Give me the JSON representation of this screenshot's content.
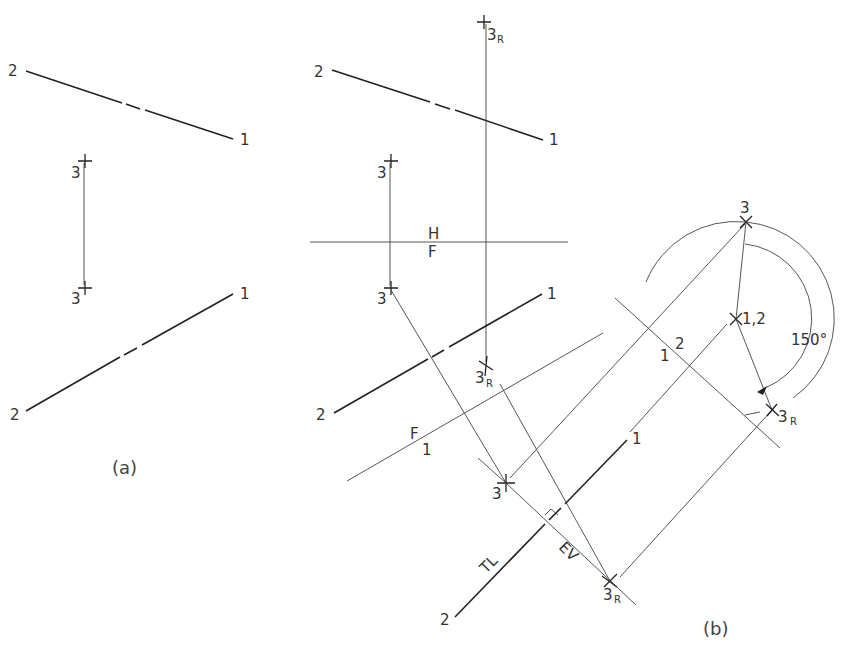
{
  "figure_a": {
    "caption": "(a)",
    "top_view": {
      "end1": "1",
      "end2": "2",
      "point3": "3"
    },
    "front_view": {
      "end1": "1",
      "end2": "2",
      "point3": "3"
    }
  },
  "figure_b": {
    "caption": "(b)",
    "fold_line_HF": {
      "upper": "H",
      "lower": "F"
    },
    "fold_line_F1": {
      "upper": "F",
      "lower": "1"
    },
    "fold_line_12": {
      "left": "1",
      "right": "2"
    },
    "top_view": {
      "end1": "1",
      "end2": "2",
      "point3": "3",
      "point3R": "3",
      "point3R_sub": "R"
    },
    "front_view": {
      "end1": "1",
      "end2": "2",
      "point3": "3",
      "point3R": "3",
      "point3R_sub": "R"
    },
    "aux_view_1": {
      "end1": "1",
      "end2": "2",
      "point3": "3",
      "point3R": "3",
      "point3R_sub": "R",
      "tl_label": "TL",
      "ev_label": "EV"
    },
    "aux_view_2": {
      "axis_label": "1,2",
      "point3": "3",
      "point3R": "3",
      "point3R_sub": "R",
      "angle": "150°"
    }
  }
}
